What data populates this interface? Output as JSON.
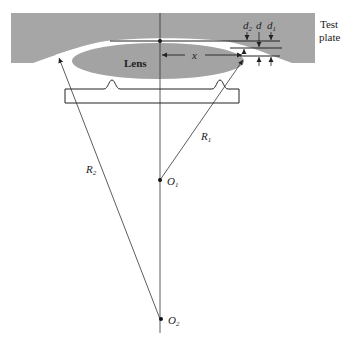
{
  "diagram": {
    "type": "optical-test-setup",
    "colors": {
      "plate": "#a6a6a6",
      "lens": "#a3a3a3",
      "line": "#222222",
      "background": "#ffffff"
    },
    "labels": {
      "test_plate_line1": "Test",
      "test_plate_line2": "plate",
      "lens": "Lens",
      "x": "x",
      "d2_main": "d",
      "d2_sub": "2",
      "d": "d",
      "d1_main": "d",
      "d1_sub": "1",
      "r1_main": "R",
      "r1_sub": "1",
      "r2_main": "R",
      "r2_sub": "2",
      "o1_main": "O",
      "o1_sub": "1",
      "o2_main": "O",
      "o2_sub": "2"
    },
    "points": {
      "O1": [
        160,
        180
      ],
      "O2": [
        160,
        319
      ]
    }
  }
}
